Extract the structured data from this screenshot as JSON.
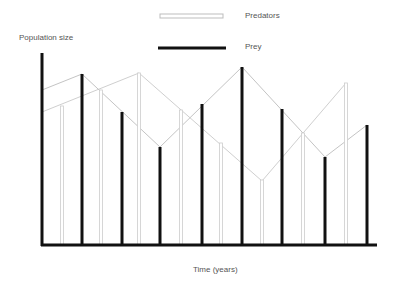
{
  "legend": {
    "predators_label": "Predators",
    "prey_label": "Prey"
  },
  "axes": {
    "ylabel": "Population size",
    "xlabel": "Time (years)"
  },
  "colors": {
    "prey": "#111111",
    "predators": "#c8c8c8",
    "axis": "#111111"
  },
  "chart_data": {
    "type": "bar",
    "title": "",
    "xlabel": "Time (years)",
    "ylabel": "Population size",
    "grid": false,
    "legend_position": "top-center",
    "legend": [
      "Predators",
      "Prey"
    ],
    "note": "No numeric tick labels; values in relative units (0 = x-axis, 100 = top of y-axis). Bars alternate prey/predator; connecting lines trace each population cycle.",
    "series": [
      {
        "name": "Prey",
        "style": "thick dark bars",
        "x": [
          82,
          122,
          160,
          202,
          242,
          282,
          325,
          367
        ],
        "values": [
          89,
          69,
          51,
          73,
          92,
          70,
          46,
          62
        ]
      },
      {
        "name": "Predators",
        "style": "thin light hollow bars",
        "x": [
          62,
          101,
          139,
          181,
          221,
          262,
          303,
          346
        ],
        "values": [
          72,
          80,
          89,
          70,
          53,
          34,
          58,
          84
        ]
      }
    ],
    "trend_lines": [
      {
        "name": "Prey",
        "points": [
          [
            42,
            90
          ],
          [
            82,
            74
          ],
          [
            160,
            147
          ],
          [
            242,
            67
          ],
          [
            325,
            157
          ],
          [
            367,
            125
          ]
        ]
      },
      {
        "name": "Predators",
        "points": [
          [
            42,
            112
          ],
          [
            139,
            73
          ],
          [
            262,
            181
          ],
          [
            346,
            83
          ]
        ]
      }
    ],
    "ylim": [
      0,
      100
    ]
  },
  "geometry": {
    "axis_x": 42,
    "axis_top": 53,
    "axis_bottom": 245,
    "axis_right": 377,
    "prey_bars": [
      [
        82,
        74
      ],
      [
        122,
        112
      ],
      [
        160,
        147
      ],
      [
        202,
        104
      ],
      [
        242,
        67
      ],
      [
        282,
        109
      ],
      [
        325,
        157
      ],
      [
        367,
        125
      ]
    ],
    "pred_bars": [
      [
        62,
        106
      ],
      [
        101,
        90
      ],
      [
        139,
        73
      ],
      [
        181,
        110
      ],
      [
        221,
        143
      ],
      [
        262,
        180
      ],
      [
        303,
        133
      ],
      [
        346,
        83
      ]
    ],
    "prey_line": "42,90 82,74 160,147 242,67 325,157 367,125",
    "pred_line": "42,112 139,73 262,181 346,83"
  }
}
